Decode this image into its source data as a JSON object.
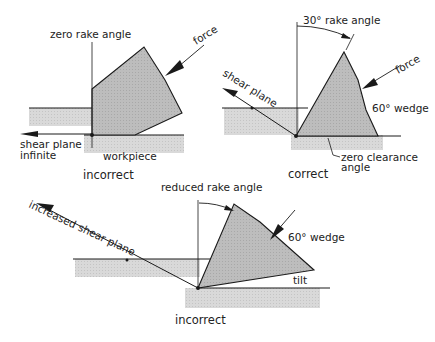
{
  "diagram": {
    "panel_top_left": {
      "caption": "incorrect",
      "labels": {
        "rake": "zero rake angle",
        "force": "force",
        "shear1": "shear plane",
        "shear2": "infinite",
        "workpiece": "workpiece"
      }
    },
    "panel_top_right": {
      "caption": "correct",
      "labels": {
        "rake": "30° rake angle",
        "force": "force",
        "shear": "shear plane",
        "wedge": "60° wedge",
        "clearance1": "zero clearance",
        "clearance2": "angle"
      }
    },
    "panel_bottom": {
      "caption": "incorrect",
      "labels": {
        "rake": "reduced rake angle",
        "shear": "increased shear plane",
        "wedge": "60° wedge",
        "tilt": "tilt"
      }
    },
    "colors": {
      "tool_fill": "#b8b8b8",
      "workpiece_fill": "#d6d6d6",
      "line": "#1a1a1a"
    }
  }
}
